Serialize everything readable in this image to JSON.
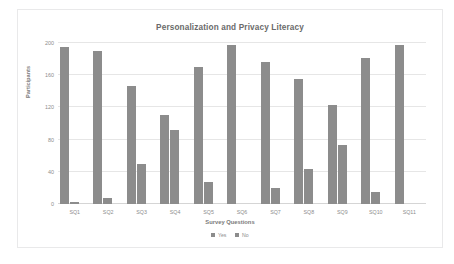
{
  "chart_data": {
    "type": "bar",
    "title": "Personalization and Privacy Literacy",
    "xlabel": "Survey Questions",
    "ylabel": "Participants",
    "categories": [
      "SQ1",
      "SQ2",
      "SQ3",
      "SQ4",
      "SQ5",
      "SQ6",
      "SQ7",
      "SQ8",
      "SQ9",
      "SQ10",
      "SQ11"
    ],
    "series": [
      {
        "name": "Yes",
        "color": "#8c8c8c",
        "values": [
          195,
          190,
          147,
          110,
          170,
          197,
          177,
          155,
          123,
          182,
          197
        ]
      },
      {
        "name": "No",
        "color": "#8c8c8c",
        "values": [
          3,
          7,
          50,
          92,
          27,
          0,
          20,
          44,
          73,
          15,
          0
        ]
      }
    ],
    "ylim": [
      0,
      200
    ],
    "yticks": [
      0,
      40,
      80,
      120,
      160,
      200
    ],
    "ytick_labels": [
      "0",
      "40",
      "80",
      "120",
      "160",
      "200"
    ],
    "grid": "horizontal",
    "legend_position": "bottom"
  }
}
